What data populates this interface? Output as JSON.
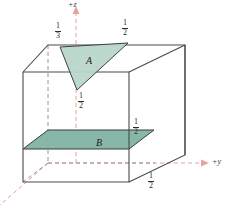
{
  "figure": {
    "type": "3d-geometry-diagram",
    "background_color": "#ffffff"
  },
  "colors": {
    "box_edge": "#4a4a4a",
    "box_edge_hidden": "#6e6e6e",
    "axis": "#e8a0a0",
    "axis_label": "#3a3a3a",
    "region_a_fill": "#b9d6c9",
    "region_a_stroke": "#3f3f3f",
    "region_b_fill": "#7fb3a3",
    "region_b_stroke": "#3a3a3a",
    "text": "#2b2b2b"
  },
  "axes": [
    {
      "name": "z-axis",
      "label": "+z",
      "direction": "up",
      "style": "dashed-with-arrow"
    },
    {
      "name": "y-axis",
      "label": "+y",
      "direction": "right",
      "style": "dashed-with-arrow"
    },
    {
      "name": "x-axis",
      "label": "",
      "direction": "down-left",
      "style": "dashed"
    }
  ],
  "regions": [
    {
      "id": "A",
      "label": "A",
      "shape": "triangle",
      "fill": "#b9d6c9"
    },
    {
      "id": "B",
      "label": "B",
      "shape": "parallelogram",
      "fill": "#7fb3a3"
    }
  ],
  "measurements": [
    {
      "id": "m1",
      "numerator": "1",
      "denominator": "3",
      "position": "top-left-of-triangle",
      "value": "1/3"
    },
    {
      "id": "m2",
      "numerator": "1",
      "denominator": "2",
      "position": "top-right-of-triangle",
      "value": "1/2"
    },
    {
      "id": "m3",
      "numerator": "1",
      "denominator": "2",
      "position": "below-triangle-apex-on-z-axis",
      "value": "1/2"
    },
    {
      "id": "m4",
      "numerator": "1",
      "denominator": "2",
      "position": "right-edge-above-region-b",
      "value": "1/2"
    },
    {
      "id": "m5",
      "numerator": "1",
      "denominator": "2",
      "position": "bottom-right-corner",
      "value": "1/2"
    }
  ],
  "labels": {
    "z_axis": "+z",
    "y_axis": "+y",
    "region_a": "A",
    "region_b": "B"
  }
}
